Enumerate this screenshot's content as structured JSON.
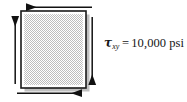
{
  "figure": {
    "type": "pure-shear-stress-element",
    "background_color": "#ffffff",
    "element": {
      "name": "square-stress-element",
      "x": 21,
      "y": 11,
      "width": 65,
      "height": 77,
      "fill_pattern": "checkerboard-dither",
      "fill_color": "#c9c9c9",
      "fill_background": "#ffffff",
      "border_color": "#1a1a1a",
      "border_width": 1.6,
      "inner_gap_color": "#ffffff",
      "shadow_color": "#8d8d8d"
    },
    "arrows": [
      {
        "name": "top-shear-arrow",
        "edge": "top",
        "direction": "left",
        "color": "#111111",
        "x1": 92,
        "y1": 7,
        "x2": 25,
        "y2": 7
      },
      {
        "name": "bottom-shear-arrow",
        "edge": "bottom",
        "direction": "right",
        "color": "#111111",
        "x1": 17,
        "y1": 93,
        "x2": 83,
        "y2": 93
      },
      {
        "name": "left-shear-arrow",
        "edge": "left",
        "direction": "up",
        "color": "#111111",
        "x1": 15,
        "y1": 84,
        "x2": 15,
        "y2": 15
      },
      {
        "name": "right-shear-arrow",
        "edge": "right",
        "direction": "down",
        "color": "#111111",
        "x1": 92,
        "y1": 17,
        "x2": 92,
        "y2": 86
      }
    ],
    "label": {
      "name": "shear-stress-label",
      "symbol": "τ",
      "subscript": "xy",
      "equals": "=",
      "value": "10,000",
      "unit": "psi",
      "full_text": "τxy = 10,000 psi",
      "color": "#161616"
    }
  }
}
